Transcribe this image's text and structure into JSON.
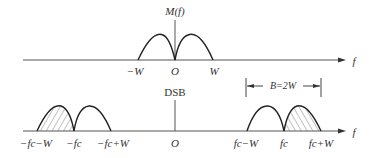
{
  "spectrum_top": {
    "title": "M(f)",
    "axis_label": "f",
    "ticks": [
      {
        "label": "−W",
        "x": 135
      },
      {
        "label": "O",
        "x": 175
      },
      {
        "label": "W",
        "x": 214
      }
    ]
  },
  "spectrum_bottom": {
    "title": "DSB",
    "axis_label": "f",
    "bandwidth_label": "B=2W",
    "ticks": [
      {
        "label": "−fc−W",
        "x": 36
      },
      {
        "label": "−fc",
        "x": 74
      },
      {
        "label": "−fc+W",
        "x": 113
      },
      {
        "label": "O",
        "x": 175
      },
      {
        "label": "fc−W",
        "x": 246
      },
      {
        "label": "fc",
        "x": 284
      },
      {
        "label": "fc+W",
        "x": 321
      }
    ]
  },
  "colors": {
    "line": "#333333",
    "axis": "#555555",
    "hatch": "#666666"
  }
}
